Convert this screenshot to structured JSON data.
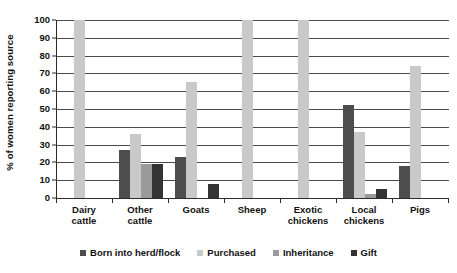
{
  "chart_data": {
    "type": "bar",
    "title": "",
    "subtitle": "",
    "xlabel": "",
    "ylabel": "% of women reporting source",
    "ylim": [
      0,
      100
    ],
    "yticks": [
      0,
      10,
      20,
      30,
      40,
      50,
      60,
      70,
      80,
      90,
      100
    ],
    "ytick_labels": [
      "0",
      "10",
      "20",
      "30",
      "40",
      "50",
      "60",
      "70",
      "80",
      "90",
      "100"
    ],
    "grid": true,
    "legend_position": "bottom",
    "categories": [
      "Dairy cattle",
      "Other cattle",
      "Goats",
      "Sheep",
      "Exotic chickens",
      "Local chickens",
      "Pigs"
    ],
    "category_lines": [
      [
        "Dairy",
        "cattle"
      ],
      [
        "Other",
        "cattle"
      ],
      [
        "Goats",
        ""
      ],
      [
        "Sheep",
        ""
      ],
      [
        "Exotic",
        "chickens"
      ],
      [
        "Local",
        "chickens"
      ],
      [
        "Pigs",
        ""
      ]
    ],
    "series": [
      {
        "name": "Born into herd/flock",
        "color": "#4d4d4d",
        "values": [
          0,
          27,
          23,
          0,
          0,
          52,
          18
        ]
      },
      {
        "name": "Purchased",
        "color": "#c9c9c9",
        "values": [
          100,
          36,
          65,
          100,
          100,
          37,
          74
        ]
      },
      {
        "name": "Inheritance",
        "color": "#9a9a9a",
        "values": [
          0,
          19,
          0,
          0,
          0,
          2,
          0
        ]
      },
      {
        "name": "Gift",
        "color": "#333333",
        "values": [
          0,
          19,
          8,
          0,
          0,
          5,
          0
        ]
      }
    ]
  }
}
